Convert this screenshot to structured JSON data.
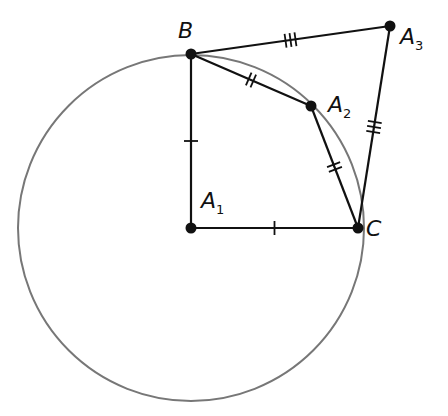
{
  "diagram": {
    "circle": {
      "center": "A1",
      "cx": 191,
      "cy": 228,
      "r": 173,
      "color": "#777777"
    },
    "points": [
      {
        "id": "B",
        "label": "B",
        "sub": "",
        "x": 191,
        "y": 54
      },
      {
        "id": "A1",
        "label": "A",
        "sub": "1",
        "x": 191,
        "y": 228
      },
      {
        "id": "C",
        "label": "C",
        "sub": "",
        "x": 358,
        "y": 228
      },
      {
        "id": "A2",
        "label": "A",
        "sub": "2",
        "x": 311,
        "y": 106
      },
      {
        "id": "A3",
        "label": "A",
        "sub": "3",
        "x": 390,
        "y": 26
      }
    ],
    "segments": [
      {
        "from": "B",
        "to": "A1",
        "ticks": 1
      },
      {
        "from": "A1",
        "to": "C",
        "ticks": 1
      },
      {
        "from": "B",
        "to": "A2",
        "ticks": 2
      },
      {
        "from": "A2",
        "to": "C",
        "ticks": 2
      },
      {
        "from": "B",
        "to": "A3",
        "ticks": 3
      },
      {
        "from": "A3",
        "to": "C",
        "ticks": 3
      }
    ]
  }
}
